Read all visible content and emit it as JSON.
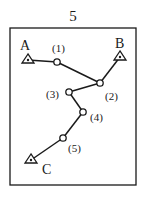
{
  "figure": {
    "number": "5",
    "supports": [
      {
        "id": "A",
        "label": "A",
        "x": 28,
        "y": 60
      },
      {
        "id": "B",
        "label": "B",
        "x": 120,
        "y": 57
      },
      {
        "id": "C",
        "label": "C",
        "x": 31,
        "y": 160
      }
    ],
    "nodes": [
      {
        "id": "1",
        "label": "(1)",
        "x": 57,
        "y": 62
      },
      {
        "id": "2",
        "label": "(2)",
        "x": 100,
        "y": 83
      },
      {
        "id": "3",
        "label": "(3)",
        "x": 69,
        "y": 92
      },
      {
        "id": "4",
        "label": "(4)",
        "x": 83,
        "y": 112
      },
      {
        "id": "5",
        "label": "(5)",
        "x": 63,
        "y": 138
      }
    ],
    "colors": {
      "line": "#1a1a1a",
      "background": "#ffffff"
    }
  }
}
